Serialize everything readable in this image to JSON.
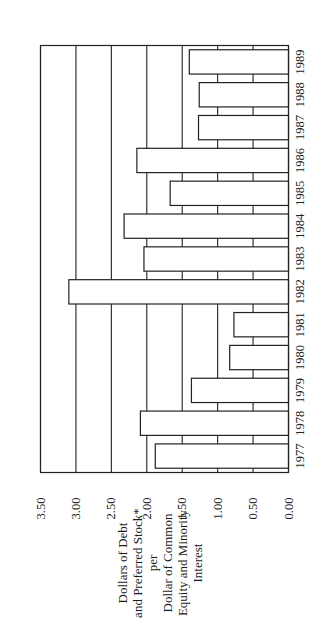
{
  "chart_data": {
    "type": "bar",
    "orientation": "rotated-90-vertical-bars",
    "title": "",
    "xlabel": "",
    "ylabel": "Dollars of Debt and Preferred Stock* per Dollar of Common Equity and Minority Interest",
    "ylabel_lines": [
      "Dollars of Debt",
      "and Preferred  Stock*",
      "per",
      "Dollar of Common",
      "Equity and Minority",
      "Interest"
    ],
    "categories": [
      "1977",
      "1978",
      "1979",
      "1980",
      "1981",
      "1982",
      "1983",
      "1984",
      "1985",
      "1986",
      "1987",
      "1988",
      "1989"
    ],
    "values": [
      1.88,
      2.09,
      1.37,
      0.83,
      0.77,
      3.1,
      2.04,
      2.32,
      1.67,
      2.14,
      1.27,
      1.26,
      1.4
    ],
    "ylim": [
      0,
      3.5
    ],
    "yticks": [
      "0.00",
      "0.50",
      "1.00",
      "1.50",
      "2.00",
      "2.50",
      "3.00",
      "3.50"
    ],
    "grid": true,
    "legend": null
  }
}
